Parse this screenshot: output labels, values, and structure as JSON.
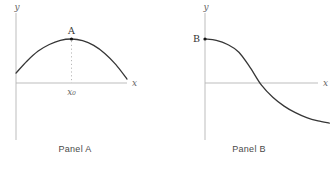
{
  "figure": {
    "background": "#ffffff"
  },
  "colors": {
    "axis": "#b5b5b5",
    "curve": "#363636",
    "dashed": "#b0b0b0",
    "math_label": "#666666",
    "point": "#161616",
    "point_label": "#333333",
    "caption": "#4a4a4a"
  },
  "chart_data": [
    {
      "type": "line",
      "title": "Panel A",
      "xlabel": "x",
      "ylabel": "y",
      "x": [
        0,
        1,
        2,
        3,
        4,
        5,
        6,
        7,
        8,
        9,
        10
      ],
      "y": [
        0.9,
        2.0,
        2.9,
        3.5,
        3.88,
        4.0,
        3.85,
        3.42,
        2.69,
        1.67,
        0.36
      ],
      "axes": {
        "ticks": "none",
        "grid": false,
        "x_range_shown": [
          0,
          10
        ],
        "y_range_shown": [
          -5.2,
          6.4
        ]
      },
      "annotations": [
        {
          "type": "point",
          "label": "A",
          "x": 5,
          "y": 4.0,
          "label_position": "above"
        },
        {
          "type": "dashed-line",
          "from": [
            5,
            4.0
          ],
          "to": [
            5,
            0
          ]
        },
        {
          "type": "tick-label",
          "label": "x₀",
          "x": 5
        }
      ]
    },
    {
      "type": "line",
      "title": "Panel B",
      "xlabel": "x",
      "ylabel": "y",
      "x": [
        0,
        1,
        2,
        3,
        4,
        5,
        6,
        7,
        8,
        9,
        10,
        11
      ],
      "y": [
        4.0,
        3.88,
        3.5,
        2.8,
        1.4,
        -0.2,
        -1.3,
        -2.1,
        -2.7,
        -3.15,
        -3.45,
        -3.65
      ],
      "axes": {
        "ticks": "none",
        "grid": false,
        "x_range_shown": [
          0,
          10
        ],
        "y_range_shown": [
          -5.2,
          6.4
        ]
      },
      "annotations": [
        {
          "type": "point",
          "label": "B",
          "x": 0,
          "y": 4.0,
          "label_position": "left"
        }
      ]
    }
  ]
}
